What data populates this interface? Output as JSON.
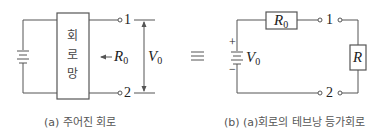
{
  "figure_a": {
    "network_label": [
      "회",
      "로",
      "망"
    ],
    "terminal_1": "1",
    "terminal_2": "2",
    "resistance_label": "R",
    "resistance_sub": "0",
    "voltage_label": "V",
    "voltage_sub": "0",
    "caption": "(a) 주어진 회로"
  },
  "equivalence_symbol": "≡",
  "figure_b": {
    "series_resistor_label": "R",
    "series_resistor_sub": "0",
    "source_plus": "+",
    "source_minus": "−",
    "source_label": "V",
    "source_sub": "0",
    "terminal_1": "1",
    "terminal_2": "2",
    "load_resistor_label": "R",
    "caption": "(b) (a)회로의 테브낭 등가회로"
  },
  "colors": {
    "line": "#555555",
    "text": "#222222",
    "caption": "#555555"
  }
}
